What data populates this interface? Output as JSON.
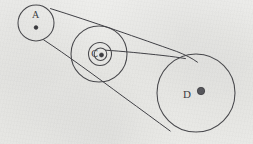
{
  "diagram": {
    "medium": "hand-drawn pencil sketch on gray paper",
    "background_color": "#e9e9e7",
    "ink_color": "#46464a",
    "canvas": {
      "width": 253,
      "height": 144
    },
    "pulleys": [
      {
        "id": "A",
        "label": "A",
        "label_x": 35,
        "label_y": 16,
        "center_x": 36,
        "center_y": 23,
        "radius": 18,
        "hub_x": 36,
        "hub_y": 27,
        "hub_radius": 1.8
      },
      {
        "id": "C",
        "label": "C",
        "label_x": 95,
        "label_y": 54,
        "center_x": 99,
        "center_y": 54,
        "radius": 28,
        "hub_x": 101,
        "hub_y": 55,
        "hub_radius": 2.0,
        "inner_rings": [
          11,
          6
        ]
      },
      {
        "id": "D",
        "label": "D",
        "label_x": 187,
        "label_y": 95,
        "center_x": 196,
        "center_y": 93,
        "radius": 39,
        "hub_x": 201,
        "hub_y": 91,
        "hub_radius": 3.6
      }
    ],
    "belts": [
      {
        "name": "upper-belt-a-to-d",
        "from": "A",
        "to": "D",
        "x1": 50,
        "y1": 9,
        "x2": 204,
        "y2": 56
      },
      {
        "name": "lower-belt-a-to-d",
        "from": "A",
        "to": "D",
        "x1": 44,
        "y1": 40,
        "x2": 170,
        "y2": 124
      },
      {
        "name": "belt-c-hub-to-d",
        "from": "C",
        "to": "D",
        "x1": 106,
        "y1": 50,
        "x2": 181,
        "y2": 58
      }
    ]
  }
}
